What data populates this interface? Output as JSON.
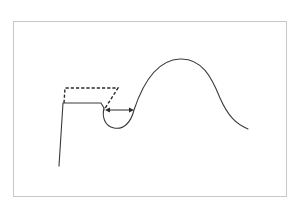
{
  "figure": {
    "type": "line-drawing",
    "colors": {
      "background": "#ffffff",
      "frame": "#c8c8c8",
      "stroke": "#3a3a3a"
    },
    "frame": {
      "x": 13,
      "y": 21,
      "width": 274,
      "height": 176
    },
    "elements": {
      "wall_and_ledge": {
        "style": "solid",
        "points": [
          [
            59,
            166
          ],
          [
            63,
            103
          ],
          [
            101,
            103
          ],
          [
            104,
            108
          ]
        ]
      },
      "dashed_outline": {
        "style": "dashed",
        "points": [
          [
            63,
            103
          ],
          [
            64,
            88
          ],
          [
            118,
            88
          ],
          [
            104,
            110
          ]
        ]
      },
      "curve": {
        "style": "solid",
        "label": "notch-and-hump curve"
      },
      "dimension_arrow": {
        "style": "double-headed",
        "from": [
          106,
          110
        ],
        "to": [
          133,
          110
        ]
      }
    }
  }
}
